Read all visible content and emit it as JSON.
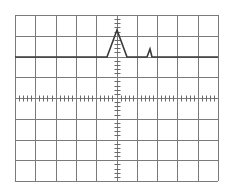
{
  "graticule": {
    "left": 15,
    "top": 15,
    "right": 218,
    "bottom": 181,
    "h_divisions": 10,
    "v_divisions": 8,
    "minor_ticks_per_division": 5,
    "grid_color": "#7a7a7a",
    "tick_color": "#6a6a6a",
    "background": "#ffffff"
  },
  "trace": {
    "color": "#3a3a3a",
    "width": 1.6,
    "baseline_y": 57,
    "points": [
      [
        15,
        57
      ],
      [
        107,
        57
      ],
      [
        117,
        30
      ],
      [
        127,
        57
      ],
      [
        147,
        57
      ],
      [
        150,
        49
      ],
      [
        152,
        57
      ],
      [
        218,
        57
      ]
    ]
  },
  "chart_data": {
    "type": "line",
    "title": "",
    "xlabel": "",
    "ylabel": "",
    "grid": true,
    "x_divisions": 10,
    "y_divisions": 8,
    "series": [
      {
        "name": "trace",
        "x_div": [
          0,
          4.53,
          5.02,
          5.52,
          6.5,
          6.65,
          6.75,
          10
        ],
        "y_div_from_top": [
          2,
          2,
          0.7,
          2,
          2,
          1.6,
          2,
          2
        ]
      }
    ]
  }
}
